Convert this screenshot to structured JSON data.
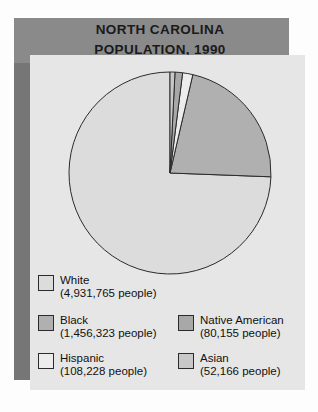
{
  "title": {
    "line1": "NORTH CAROLINA",
    "line2": "POPULATION, 1990"
  },
  "colors": {
    "banner": "#8a8a8a",
    "left_band": "#767676",
    "panel": "#e6e6e6",
    "outline": "#2b2b2b",
    "white_slice": "#dcdcdc",
    "black_slice": "#b0b0b0",
    "hispanic_slice": "#ececec",
    "native_american_slice": "#a8a8a8",
    "asian_slice": "#c8c8c8"
  },
  "legend": {
    "left": [
      {
        "label": "White",
        "count": "(4,931,765 people)",
        "swatch": "#dcdcdc",
        "name": "white"
      },
      {
        "label": "Black",
        "count": "(1,456,323 people)",
        "swatch": "#b0b0b0",
        "name": "black"
      },
      {
        "label": "Hispanic",
        "count": "(108,228 people)",
        "swatch": "#ececec",
        "name": "hispanic"
      }
    ],
    "right": [
      {
        "label": "Native American",
        "count": "(80,155 people)",
        "swatch": "#a8a8a8",
        "name": "native-american"
      },
      {
        "label": "Asian",
        "count": "(52,166 people)",
        "swatch": "#c8c8c8",
        "name": "asian"
      }
    ]
  },
  "chart_data": {
    "type": "pie",
    "title": "NORTH CAROLINA POPULATION, 1990",
    "xlabel": "",
    "ylabel": "",
    "grid": false,
    "legend_position": "bottom",
    "start_angle_deg": 90,
    "direction": "counterclockwise",
    "total": 6628637,
    "categories": [
      "White",
      "Black",
      "Hispanic",
      "Native American",
      "Asian"
    ],
    "values": [
      4931765,
      1456323,
      108228,
      80155,
      52166
    ],
    "value_labels": [
      "(4,931,765 people)",
      "(1,456,323 people)",
      "(108,228 people)",
      "(80,155 people)",
      "(52,166 people)"
    ],
    "percentages": [
      74.4,
      22.0,
      1.6,
      1.2,
      0.8
    ],
    "slice_colors": [
      "#dcdcdc",
      "#b0b0b0",
      "#ececec",
      "#a8a8a8",
      "#c8c8c8"
    ]
  }
}
